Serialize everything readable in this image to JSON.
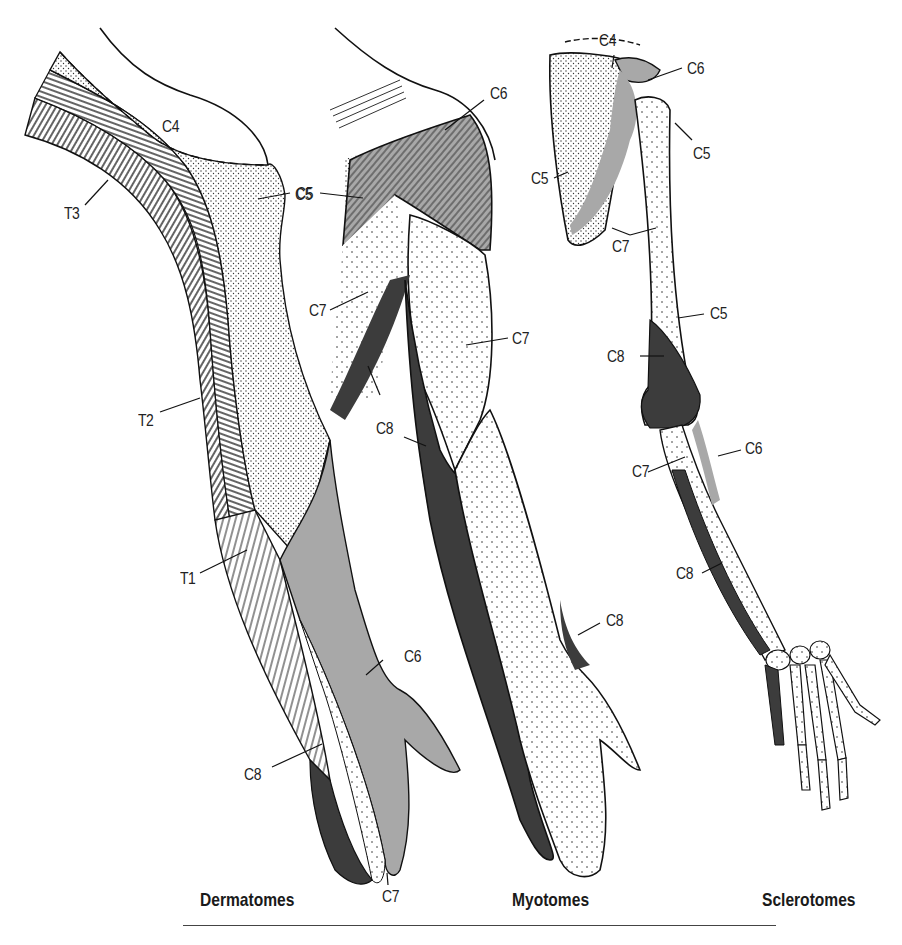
{
  "figure": {
    "panels": [
      {
        "id": "dermatomes",
        "caption": "Dermatomes",
        "labels": [
          "C4",
          "C5",
          "T3",
          "T2",
          "T1",
          "C6",
          "C8",
          "C7"
        ]
      },
      {
        "id": "myotomes",
        "caption": "Myotomes",
        "labels": [
          "C6",
          "C5",
          "C7",
          "C7",
          "C8",
          "C8",
          "C8"
        ]
      },
      {
        "id": "sclerotomes",
        "caption": "Sclerotomes",
        "labels": [
          "C4",
          "C6",
          "C5",
          "C5",
          "C7",
          "C5",
          "C8",
          "C6",
          "C7",
          "C8"
        ]
      }
    ],
    "legend_shading": {
      "C4": "white",
      "C5": "dense-stipple",
      "C6": "light-gray",
      "C7": "sparse-dots",
      "C8": "dark-gray",
      "T1": "diagonal-hatch",
      "T2": "horizontal-hatch",
      "T3": "vertical-hatch"
    },
    "colors": {
      "outline": "#111111",
      "c6_fill": "#a8a8a8",
      "c8_fill": "#3c3c3c",
      "background": "#ffffff"
    }
  }
}
